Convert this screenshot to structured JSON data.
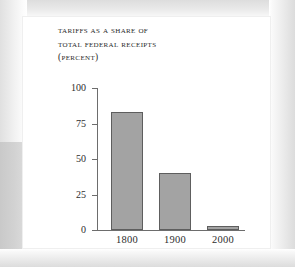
{
  "figure": {
    "background_color": "#ffffff",
    "bar_fill_color": "#a3a3a3",
    "bar_edge_color": "#5e5e5e",
    "axis_color": "#6d6d6d",
    "text_color": "#2d2d2d"
  },
  "title": {
    "line1": "Tariffs as a share of",
    "line2": "total federal receipts",
    "line3": "(percent)"
  },
  "chart_data": {
    "type": "bar",
    "title": "TARIFFS AS A SHARE OF TOTAL FEDERAL RECEIPTS (PERCENT)",
    "subtitle": "",
    "xlabel": "",
    "ylabel": "",
    "categories": [
      "1800",
      "1900",
      "2000"
    ],
    "values": [
      83,
      40,
      2.5
    ],
    "series": [
      {
        "name": "Tariffs as a share of total federal receipts",
        "values": [
          83,
          40,
          2.5
        ]
      }
    ],
    "ylim": [
      0,
      100
    ],
    "yticks": [
      0,
      25,
      50,
      75,
      100
    ],
    "ytick_labels": [
      "0",
      "25",
      "50",
      "75",
      "100"
    ],
    "xtick_labels": [
      "1800",
      "1900",
      "2000"
    ],
    "grid": false,
    "legend": null,
    "annotations": []
  }
}
